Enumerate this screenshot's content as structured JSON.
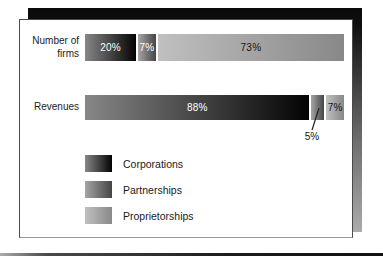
{
  "chart_data": {
    "type": "bar",
    "orientation": "horizontal",
    "stacked": true,
    "grid": false,
    "legend_position": "bottom-left",
    "categories": [
      "Number of firms",
      "Revenues"
    ],
    "series": [
      {
        "name": "Corporations",
        "values": [
          20,
          88
        ],
        "gradient": [
          "#878787",
          "#030303"
        ]
      },
      {
        "name": "Partnerships",
        "values": [
          7,
          5
        ],
        "gradient": [
          "#a5a5a5",
          "#454545"
        ]
      },
      {
        "name": "Proprietorships",
        "values": [
          73,
          7
        ],
        "gradient": [
          "#c0c0c0",
          "#888888"
        ]
      }
    ],
    "value_labels": [
      [
        "20%",
        "7%",
        "73%"
      ],
      [
        "88%",
        "",
        "7%"
      ]
    ],
    "value_label_colors": [
      [
        "#ffffff",
        "#ffffff",
        "#151515"
      ],
      [
        "#ffffff",
        "",
        "#151515"
      ]
    ],
    "callout": {
      "text": "5%",
      "row": "Revenues",
      "series": "Partnerships"
    },
    "xlim": [
      0,
      100
    ],
    "unit": "%"
  },
  "colors": {
    "panel_bg": "#ffffff",
    "shadow_top": "#0a0a0a",
    "shadow_bottom": "#ababab",
    "text": "#1b1b1b"
  }
}
